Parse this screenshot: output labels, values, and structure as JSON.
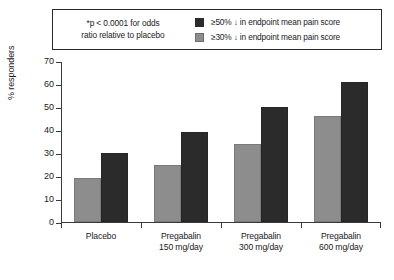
{
  "legend": {
    "note_line1": "*p < 0.0001 for odds",
    "note_line2": "ratio relative to placebo",
    "entries": [
      {
        "swatch": "dark",
        "label": "≥50% ↓ in endpoint mean pain score",
        "color": "#2b2b2b"
      },
      {
        "swatch": "gray",
        "label": "≥30% ↓ in endpoint mean pain score",
        "color": "#8d8d8d"
      }
    ]
  },
  "axis": {
    "y_title": "% responders",
    "y_ticks": [
      "0",
      "10",
      "20",
      "30",
      "40",
      "50",
      "60",
      "70"
    ]
  },
  "categories_display": [
    {
      "line1": "Placebo",
      "line2": ""
    },
    {
      "line1": "Pregabalin",
      "line2": "150 mg/day"
    },
    {
      "line1": "Pregabalin",
      "line2": "300 mg/day"
    },
    {
      "line1": "Pregabalin",
      "line2": "600 mg/day"
    }
  ],
  "chart_data": {
    "type": "bar",
    "title": "",
    "xlabel": "",
    "ylabel": "% responders",
    "ylim": [
      0,
      70
    ],
    "ytick_step": 10,
    "grid": false,
    "legend_position": "top",
    "categories": [
      "Placebo",
      "Pregabalin 150 mg/day",
      "Pregabalin 300 mg/day",
      "Pregabalin 600 mg/day"
    ],
    "series": [
      {
        "name": "≥30% ↓ in endpoint mean pain score",
        "color": "#8d8d8d",
        "values": [
          19,
          25,
          34,
          46
        ]
      },
      {
        "name": "≥50% ↓ in endpoint mean pain score",
        "color": "#2b2b2b",
        "values": [
          30,
          39,
          50,
          61
        ]
      }
    ],
    "annotations": [
      "*p < 0.0001 for odds ratio relative to placebo"
    ]
  }
}
